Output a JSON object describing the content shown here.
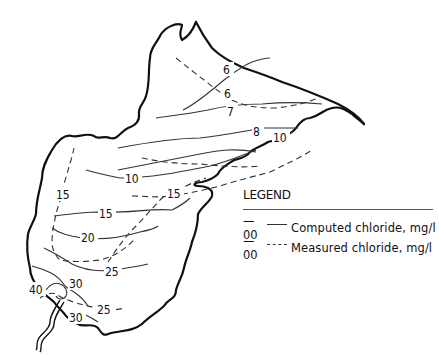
{
  "diagram": {
    "type": "isoline-map",
    "line_color": "#333333",
    "coast_color": "#111111",
    "background": "#ffffff"
  },
  "legend": {
    "title": "LEGEND",
    "items": [
      {
        "code": "—00",
        "style": "solid",
        "label": "Computed chloride, mg/l"
      },
      {
        "code": "—00",
        "style": "dashed",
        "label": "Measured chloride, mg/l"
      }
    ]
  },
  "contour_labels": {
    "computed": {
      "c6": "6",
      "c7": "7",
      "c8": "8",
      "c10": "10",
      "c15": "15",
      "c20": "20",
      "c25": "25",
      "c30_top": "30",
      "c30_bottom": "30",
      "c40": "40"
    },
    "measured": {
      "m6": "6",
      "m10": "10",
      "m15_left": "15",
      "m15_right": "15",
      "m25": "25"
    }
  }
}
